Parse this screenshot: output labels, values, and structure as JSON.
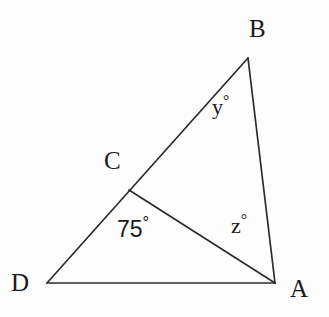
{
  "figure": {
    "kind": "geometry-diagram",
    "width": 329,
    "height": 317,
    "background_color": "#fdfdfd",
    "stroke_color": "#2b2b2b"
  },
  "points": [
    {
      "id": "B",
      "label": "B",
      "x": 248,
      "y": 58,
      "label_x": 249,
      "label_y": 16
    },
    {
      "id": "C",
      "label": "C",
      "x": 129,
      "y": 190,
      "label_x": 104,
      "label_y": 148
    },
    {
      "id": "D",
      "label": "D",
      "x": 47,
      "y": 283,
      "label_x": 11,
      "label_y": 270
    },
    {
      "id": "A",
      "label": "A",
      "x": 275,
      "y": 283,
      "label_x": 290,
      "label_y": 276
    }
  ],
  "segments": [
    {
      "id": "DB",
      "from": "D",
      "to": "B",
      "note": "straight line through C"
    },
    {
      "id": "BA",
      "from": "B",
      "to": "A"
    },
    {
      "id": "DA",
      "from": "D",
      "to": "A"
    },
    {
      "id": "CA",
      "from": "C",
      "to": "A",
      "note": "cevian"
    }
  ],
  "angle_labels": [
    {
      "id": "angle-y",
      "vertex": "B",
      "value": "y",
      "degree_symbol": "°",
      "numeric": false,
      "x": 212,
      "y": 93
    },
    {
      "id": "angle-z",
      "vertex": "A",
      "value": "z",
      "degree_symbol": "°",
      "numeric": false,
      "x": 231,
      "y": 212
    },
    {
      "id": "angle-dca",
      "vertex": "C",
      "value": "75",
      "degree_symbol": "°",
      "numeric": true,
      "x": 117,
      "y": 215
    }
  ]
}
